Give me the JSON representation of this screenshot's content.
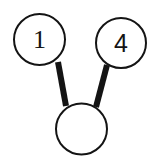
{
  "figure": {
    "type": "number-bond",
    "background_color": "#ffffff",
    "stroke_color": "#141414",
    "circle_outline_width": 2,
    "connector_width": 6
  },
  "nodes": {
    "part_left": {
      "name": "part-1",
      "value": "1",
      "filled": true,
      "center_x": 39.5,
      "center_y": 39.5,
      "radius": 26.5
    },
    "part_right": {
      "name": "part-2",
      "value": "4",
      "filled": true,
      "center_x": 121,
      "center_y": 43,
      "radius": 26
    },
    "whole": {
      "name": "whole",
      "value": "",
      "filled": false,
      "center_x": 81.5,
      "center_y": 129,
      "radius": 26.5
    }
  },
  "connectors": [
    {
      "name": "connector-part-1-to-whole",
      "from": "part_left",
      "to": "whole",
      "x1": 58,
      "y1": 62,
      "x2": 66,
      "y2": 106
    },
    {
      "name": "connector-part-2-to-whole",
      "from": "part_right",
      "to": "whole",
      "x1": 107,
      "y1": 65,
      "x2": 96,
      "y2": 107
    }
  ]
}
